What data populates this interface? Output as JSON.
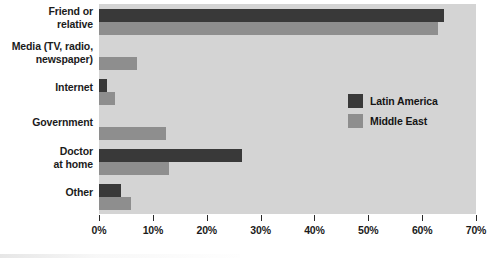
{
  "chart_data": {
    "type": "bar",
    "orientation": "horizontal",
    "title": "",
    "xlabel": "",
    "ylabel": "",
    "xlim": [
      0,
      70
    ],
    "xticks": [
      0,
      10,
      20,
      30,
      40,
      50,
      60,
      70
    ],
    "xtick_labels": [
      "0%",
      "10%",
      "20%",
      "30%",
      "40%",
      "50%",
      "60%",
      "70%"
    ],
    "grid": false,
    "legend_position": "center-right",
    "categories": [
      "Friend or\nrelative",
      "Media (TV, radio,\nnewspaper)",
      "Internet",
      "Government",
      "Doctor\nat home",
      "Other"
    ],
    "series": [
      {
        "name": "Latin America",
        "color": "#393939",
        "values": [
          64,
          0,
          1.5,
          0,
          26.5,
          4
        ]
      },
      {
        "name": "Middle East",
        "color": "#8e8e8e",
        "values": [
          63,
          7,
          3,
          12.5,
          13,
          6
        ]
      }
    ]
  },
  "legend": {
    "items": [
      {
        "label": "Latin America",
        "color": "#393939"
      },
      {
        "label": "Middle East",
        "color": "#8e8e8e"
      }
    ]
  },
  "style": {
    "plot_background": "#d4d4d4",
    "page_background": "#ffffff",
    "text_color": "#1b1b1b"
  }
}
